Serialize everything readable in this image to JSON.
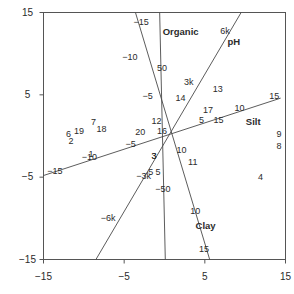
{
  "chart_data": {
    "type": "scatter",
    "title": "",
    "xlabel": "",
    "ylabel": "",
    "xlim": [
      -15,
      15
    ],
    "ylim": [
      -15,
      15
    ],
    "grid": false,
    "legend": null,
    "x_ticks": [
      "-15",
      "-5",
      "5",
      "15"
    ],
    "x_tick_values": [
      -15,
      -5,
      5,
      15
    ],
    "y_ticks": [
      "15",
      "5",
      "-5",
      "-15"
    ],
    "y_tick_values": [
      15,
      5,
      -5,
      -15
    ],
    "biplot_axes": [
      {
        "name": "Organic",
        "label": "Organic",
        "label_x": 2.0,
        "label_y": 12.6,
        "line_from": [
          -0.6,
          15.0
        ],
        "line_to": [
          0.1,
          -15.0
        ],
        "ticks": [
          {
            "label": "50",
            "x": -0.3,
            "y": 8.3
          },
          {
            "label": "-50",
            "x": -0.2,
            "y": -6.4
          }
        ]
      },
      {
        "name": "pH",
        "label": "pH",
        "label_x": 8.6,
        "label_y": 11.4,
        "line_from": [
          9.5,
          15.0
        ],
        "line_to": [
          -8.5,
          -15.0
        ],
        "ticks": [
          {
            "label": "6k",
            "x": 7.5,
            "y": 12.8
          },
          {
            "label": "3k",
            "x": 3.0,
            "y": 6.6
          },
          {
            "label": "-3k",
            "x": -2.6,
            "y": -4.8
          },
          {
            "label": "-6k",
            "x": -7.0,
            "y": -10.0
          }
        ]
      },
      {
        "name": "Silt",
        "label": "Silt",
        "label_x": 11.0,
        "label_y": 1.7,
        "line_from": [
          14.4,
          4.6
        ],
        "line_to": [
          -15.0,
          -4.8
        ],
        "ticks": [
          {
            "label": "15",
            "x": 13.6,
            "y": 4.9
          },
          {
            "label": "10",
            "x": 9.3,
            "y": 3.4
          },
          {
            "label": "5",
            "x": 4.6,
            "y": 1.9
          },
          {
            "label": "-5",
            "x": -4.2,
            "y": -1.0
          },
          {
            "label": "-10",
            "x": -9.3,
            "y": -2.6
          },
          {
            "label": "-15",
            "x": -13.6,
            "y": -4.3
          }
        ]
      },
      {
        "name": "Clay",
        "label": "Clay",
        "label_x": 5.1,
        "label_y": -10.9,
        "line_from": [
          -3.6,
          15.0
        ],
        "line_to": [
          5.6,
          -15.0
        ],
        "ticks": [
          {
            "label": "-15",
            "x": -2.9,
            "y": 13.9
          },
          {
            "label": "-10",
            "x": -4.3,
            "y": 9.6
          },
          {
            "label": "-5",
            "x": -2.1,
            "y": 4.8
          },
          {
            "label": "3",
            "x": -1.3,
            "y": -2.4
          },
          {
            "label": "5",
            "x": -0.8,
            "y": -4.4
          },
          {
            "label": "10",
            "x": 3.8,
            "y": -9.1
          },
          {
            "label": "15",
            "x": 4.9,
            "y": -13.7
          }
        ]
      }
    ],
    "points": [
      {
        "label": "1",
        "x": -9.1,
        "y": -2.2
      },
      {
        "label": "2",
        "x": -11.6,
        "y": -0.6
      },
      {
        "label": "3",
        "x": -1.3,
        "y": -2.4
      },
      {
        "label": "4",
        "x": 11.9,
        "y": -5.0
      },
      {
        "label": "5",
        "x": -1.7,
        "y": -4.4
      },
      {
        "label": "6",
        "x": -11.9,
        "y": 0.2
      },
      {
        "label": "7",
        "x": -8.8,
        "y": 1.7
      },
      {
        "label": "8",
        "x": 14.2,
        "y": -1.2
      },
      {
        "label": "9",
        "x": 14.2,
        "y": 0.2
      },
      {
        "label": "10",
        "x": 2.1,
        "y": -1.7
      },
      {
        "label": "11",
        "x": 3.5,
        "y": -3.1
      },
      {
        "label": "12",
        "x": -1.0,
        "y": 1.8
      },
      {
        "label": "13",
        "x": 6.6,
        "y": 5.7
      },
      {
        "label": "14",
        "x": 2.0,
        "y": 4.6
      },
      {
        "label": "15",
        "x": 6.7,
        "y": 2.0
      },
      {
        "label": "16",
        "x": -0.3,
        "y": 0.6
      },
      {
        "label": "17",
        "x": 5.4,
        "y": 3.1
      },
      {
        "label": "18",
        "x": -7.8,
        "y": 0.9
      },
      {
        "label": "19",
        "x": -10.6,
        "y": 0.6
      },
      {
        "label": "20",
        "x": -3.0,
        "y": 0.5
      }
    ]
  },
  "colors": {
    "frame": "#555555",
    "line": "#4a4a4a",
    "text": "#2b2b2b",
    "background": "#ffffff"
  }
}
